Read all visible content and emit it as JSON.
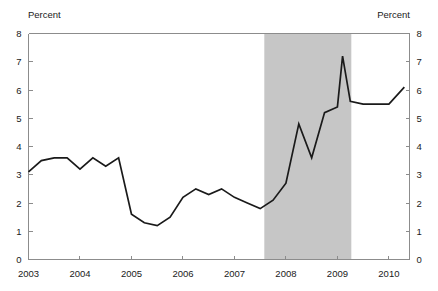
{
  "chart_data": {
    "type": "line",
    "title": "",
    "subtitle": "",
    "xlabel": "",
    "ylabel_left": "Percent",
    "ylabel_right": "Percent",
    "xlim": [
      2003.0,
      2010.4
    ],
    "ylim": [
      0,
      8
    ],
    "yticks": [
      0,
      1,
      2,
      3,
      4,
      5,
      6,
      7,
      8
    ],
    "ytick_labels": [
      "0",
      "1",
      "2",
      "3",
      "4",
      "5",
      "6",
      "7",
      "8"
    ],
    "xticks": [
      2003,
      2004,
      2005,
      2006,
      2007,
      2008,
      2009,
      2010
    ],
    "xtick_labels": [
      "2003",
      "2004",
      "2005",
      "2006",
      "2007",
      "2008",
      "2009",
      "2010"
    ],
    "grid": false,
    "legend": "none",
    "line_color": "#1a1a1a",
    "shading_color": "#c6c6c6",
    "axis_color": "#8c8c8c",
    "background_color": "#ffffff",
    "shaded_regions": [
      {
        "label": "recession",
        "x_start": 2007.58,
        "x_end": 2009.27,
        "color": "#c6c6c6"
      }
    ],
    "series": [
      {
        "name": "Percent",
        "x": [
          2003.0,
          2003.25,
          2003.5,
          2003.75,
          2004.0,
          2004.25,
          2004.5,
          2004.75,
          2005.0,
          2005.25,
          2005.5,
          2005.75,
          2006.0,
          2006.25,
          2006.5,
          2006.75,
          2007.0,
          2007.25,
          2007.5,
          2007.75,
          2008.0,
          2008.25,
          2008.5,
          2008.75,
          2009.0,
          2009.1,
          2009.25,
          2009.5,
          2009.75,
          2010.0,
          2010.3
        ],
        "values": [
          3.1,
          3.5,
          3.6,
          3.6,
          3.2,
          3.6,
          3.3,
          3.6,
          1.6,
          1.3,
          1.2,
          1.5,
          2.2,
          2.5,
          2.3,
          2.5,
          2.2,
          2.0,
          1.8,
          2.1,
          2.7,
          4.8,
          3.6,
          5.2,
          5.4,
          7.2,
          5.6,
          5.5,
          5.5,
          5.5,
          6.1
        ]
      }
    ]
  },
  "labels": {
    "left_unit": "Percent",
    "right_unit": "Percent"
  }
}
